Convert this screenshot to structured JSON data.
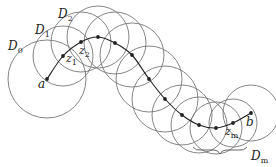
{
  "diagram": {
    "stroke_color": "#777777",
    "path_color": "#222222",
    "points": [
      {
        "x": 47,
        "y": 79,
        "r": 39
      },
      {
        "x": 63,
        "y": 56,
        "r": 30
      },
      {
        "x": 81,
        "y": 42,
        "r": 30
      },
      {
        "x": 98,
        "y": 37,
        "r": 31
      },
      {
        "x": 115,
        "y": 43,
        "r": 31
      },
      {
        "x": 132,
        "y": 55,
        "r": 32
      },
      {
        "x": 149,
        "y": 79,
        "r": 33
      },
      {
        "x": 165,
        "y": 99,
        "r": 33
      },
      {
        "x": 182,
        "y": 115,
        "r": 30
      },
      {
        "x": 199,
        "y": 125,
        "r": 28
      },
      {
        "x": 216,
        "y": 128,
        "r": 26
      },
      {
        "x": 233,
        "y": 123,
        "r": 24
      },
      {
        "x": 251,
        "y": 113,
        "r": 28
      }
    ],
    "labels": {
      "D0": "D",
      "D0_sub": "0",
      "D1": "D",
      "D1_sub": "1",
      "D2": "D",
      "D2_sub": "2",
      "a": "a",
      "z1": "z",
      "z1_sub": "1",
      "z2": "z",
      "z2_sub": "2",
      "zm": "z",
      "zm_sub": "m",
      "b": "b",
      "Dm": "D",
      "Dm_sub": "m"
    }
  }
}
